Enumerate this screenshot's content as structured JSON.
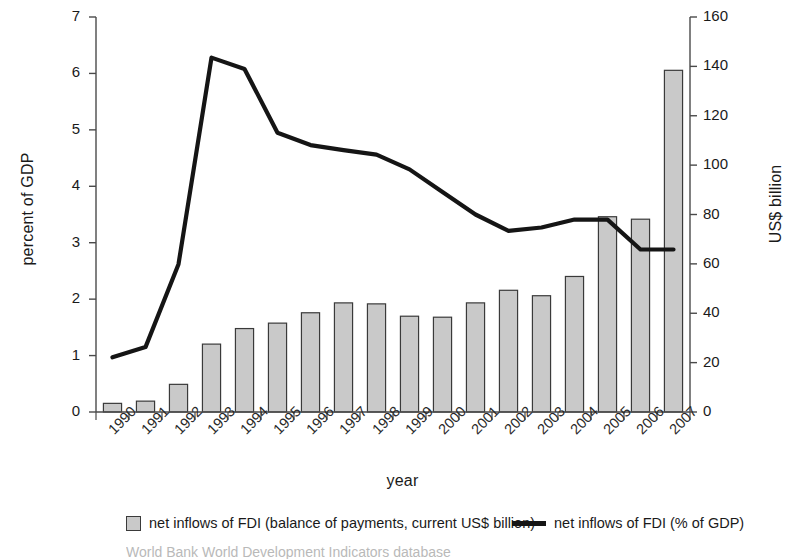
{
  "chart_data": {
    "type": "bar",
    "title": "",
    "xlabel": "year",
    "ylabel": "percent of GDP",
    "y2label": "US$ billion",
    "categories": [
      "1990",
      "1991",
      "1992",
      "1993",
      "1994",
      "1995",
      "1996",
      "1997",
      "1998",
      "1999",
      "2000",
      "2001",
      "2002",
      "2003",
      "2004",
      "2005",
      "2006",
      "2007"
    ],
    "ylim": [
      0,
      7
    ],
    "y2lim": [
      0,
      160
    ],
    "yticks": [
      0,
      1,
      2,
      3,
      4,
      5,
      6,
      7
    ],
    "y2ticks": [
      0,
      20,
      40,
      60,
      80,
      100,
      120,
      140,
      160
    ],
    "grid": false,
    "legend_position": "bottom",
    "series": [
      {
        "name": "net inflows of FDI (balance of payments, current US$ billion)",
        "type": "bar",
        "axis": "right",
        "unit": "US$ billion",
        "color": "#c9c9c9",
        "edge_color": "#3a3a3a",
        "values": [
          3.5,
          4.4,
          11.2,
          27.5,
          33.8,
          36.0,
          40.2,
          44.2,
          43.8,
          38.8,
          38.4,
          44.2,
          49.3,
          47.1,
          54.9,
          79.1,
          78.1,
          138.4
        ]
      },
      {
        "name": "net inflows of FDI (% of GDP)",
        "type": "line",
        "axis": "left",
        "unit": "percent of GDP",
        "color": "#151515",
        "values": [
          0.97,
          1.15,
          2.62,
          6.28,
          6.08,
          4.95,
          4.73,
          4.64,
          4.56,
          4.3,
          3.9,
          3.5,
          3.21,
          3.27,
          3.41,
          3.41,
          2.88,
          2.88
        ]
      }
    ],
    "series_corrections": {
      "note": "line values 1990-2007 as read from the left axis",
      "line_values_final": [
        0.97,
        1.15,
        2.62,
        6.28,
        6.08,
        4.95,
        4.73,
        4.64,
        4.56,
        4.3,
        3.9,
        3.5,
        3.21,
        3.27,
        3.41,
        3.41,
        2.88,
        2.88
      ]
    },
    "annotations": []
  },
  "axes": {
    "left_title": "percent of GDP",
    "right_title": "US$ billion",
    "x_title": "year",
    "left_ticks": [
      "0",
      "1",
      "2",
      "3",
      "4",
      "5",
      "6",
      "7"
    ],
    "right_ticks": [
      "0",
      "20",
      "40",
      "60",
      "80",
      "100",
      "120",
      "140",
      "160"
    ],
    "x_ticks": [
      "1990",
      "1991",
      "1992",
      "1993",
      "1994",
      "1995",
      "1996",
      "1997",
      "1998",
      "1999",
      "2000",
      "2001",
      "2002",
      "2003",
      "2004",
      "2005",
      "2006",
      "2007"
    ]
  },
  "legend": {
    "bar_label": "net inflows of FDI (balance of payments, current US$ billion)",
    "line_label": "net inflows of FDI (% of GDP)"
  },
  "source": {
    "text": "World Bank World Development Indicators database"
  },
  "colors": {
    "bar_fill": "#c9c9c9",
    "bar_edge": "#3a3a3a",
    "line": "#151515",
    "axis": "#4a4a4a",
    "text": "#1a1a1a",
    "background": "#ffffff"
  }
}
